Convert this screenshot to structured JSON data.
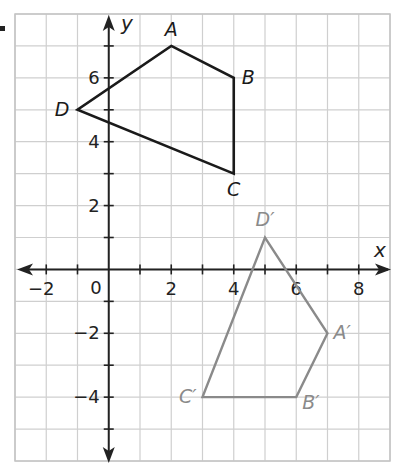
{
  "diagram": {
    "type": "coordinate-plane-translation",
    "grid": {
      "xmin": -3,
      "xmax": 9,
      "ymin": -6,
      "ymax": 8,
      "step": 1
    },
    "axes": {
      "x_label": "x",
      "y_label": "y",
      "x_tick_labels": [
        {
          "value": -2,
          "text": "−2"
        },
        {
          "value": 2,
          "text": "2"
        },
        {
          "value": 4,
          "text": "4"
        },
        {
          "value": 6,
          "text": "6"
        },
        {
          "value": 8,
          "text": "8"
        }
      ],
      "y_tick_labels": [
        {
          "value": 6,
          "text": "6"
        },
        {
          "value": 4,
          "text": "4"
        },
        {
          "value": 2,
          "text": "2"
        },
        {
          "value": -2,
          "text": "−2"
        },
        {
          "value": -4,
          "text": "−4"
        }
      ],
      "origin_label": "0"
    },
    "colors": {
      "grid": "#cfcfcf",
      "axis": "#222222",
      "original": "#1a1a1a",
      "image": "#8a8a8a"
    },
    "original_figure": {
      "name": "ABCD",
      "vertices": [
        {
          "label": "A",
          "x": 2,
          "y": 7,
          "dx": 0,
          "dy": -10,
          "anchor": "middle"
        },
        {
          "label": "B",
          "x": 4,
          "y": 6,
          "dx": 8,
          "dy": 6,
          "anchor": "start"
        },
        {
          "label": "C",
          "x": 4,
          "y": 3,
          "dx": 0,
          "dy": 22,
          "anchor": "middle"
        },
        {
          "label": "D",
          "x": -1,
          "y": 5,
          "dx": -8,
          "dy": 6,
          "anchor": "end"
        }
      ]
    },
    "image_figure": {
      "name": "A'B'C'D'",
      "vertices": [
        {
          "label": "A′",
          "x": 7,
          "y": -2,
          "dx": 6,
          "dy": 6,
          "anchor": "start"
        },
        {
          "label": "B′",
          "x": 6,
          "y": -4,
          "dx": 6,
          "dy": 12,
          "anchor": "start"
        },
        {
          "label": "C′",
          "x": 3,
          "y": -4,
          "dx": -6,
          "dy": 6,
          "anchor": "end"
        },
        {
          "label": "D′",
          "x": 5,
          "y": 1,
          "dx": 0,
          "dy": -12,
          "anchor": "middle"
        }
      ]
    }
  }
}
